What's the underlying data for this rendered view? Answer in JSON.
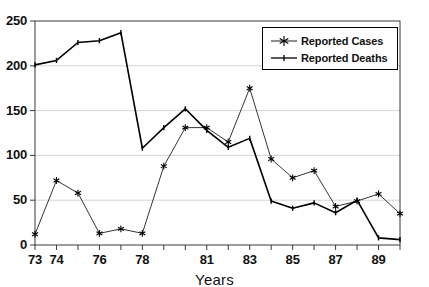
{
  "chart_data": {
    "type": "line",
    "title": "",
    "xlabel": "Years",
    "ylabel": "",
    "x": [
      73,
      74,
      75,
      76,
      77,
      78,
      79,
      80,
      81,
      82,
      83,
      84,
      85,
      86,
      87,
      88,
      89,
      90
    ],
    "xtick_labels": [
      "73",
      "74",
      "",
      "76",
      "",
      "78",
      "",
      "",
      "81",
      "",
      "83",
      "",
      "85",
      "",
      "87",
      "",
      "89",
      ""
    ],
    "xtick_labels_shown": [
      "73",
      "74",
      "76",
      "78",
      "81",
      "83",
      "85",
      "87",
      "89"
    ],
    "ytick_labels": [
      "0",
      "50",
      "100",
      "150",
      "200",
      "250"
    ],
    "yticks": [
      0,
      50,
      100,
      150,
      200,
      250
    ],
    "ylim": [
      0,
      250
    ],
    "xlim": [
      73,
      90
    ],
    "grid": "horizontal",
    "legend_position": "top-right",
    "series": [
      {
        "name": "Reported Cases",
        "marker": "asterisk",
        "values": [
          12,
          72,
          58,
          13,
          18,
          13,
          88,
          131,
          131,
          115,
          175,
          96,
          75,
          83,
          43,
          49,
          57,
          35
        ]
      },
      {
        "name": "Reported Deaths",
        "marker": "small-tick",
        "values": [
          201,
          206,
          226,
          228,
          237,
          108,
          131,
          152,
          128,
          109,
          119,
          49,
          41,
          47,
          36,
          50,
          8,
          6
        ]
      }
    ]
  },
  "axis": {
    "x_title": "Years"
  },
  "legend": {
    "items": [
      {
        "label": "Reported Cases"
      },
      {
        "label": "Reported Deaths"
      }
    ]
  }
}
